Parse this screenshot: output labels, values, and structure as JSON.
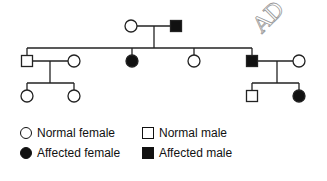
{
  "diagram": {
    "type": "pedigree",
    "annotation": "AD",
    "colors": {
      "line": "#222222",
      "affected": "#111111",
      "normal_fill": "#ffffff",
      "annotation": "#888888"
    },
    "generations": [
      {
        "id": "I",
        "individuals": [
          {
            "id": "I-1",
            "sex": "female",
            "affected": false
          },
          {
            "id": "I-2",
            "sex": "male",
            "affected": true
          }
        ],
        "couples": [
          [
            "I-1",
            "I-2"
          ]
        ]
      },
      {
        "id": "II",
        "individuals": [
          {
            "id": "II-1",
            "sex": "male",
            "affected": false,
            "parents": [
              "I-1",
              "I-2"
            ]
          },
          {
            "id": "II-1s",
            "sex": "female",
            "affected": false,
            "spouse_of": "II-1"
          },
          {
            "id": "II-2",
            "sex": "female",
            "affected": true,
            "parents": [
              "I-1",
              "I-2"
            ]
          },
          {
            "id": "II-3",
            "sex": "female",
            "affected": false,
            "parents": [
              "I-1",
              "I-2"
            ]
          },
          {
            "id": "II-4",
            "sex": "male",
            "affected": true,
            "parents": [
              "I-1",
              "I-2"
            ]
          },
          {
            "id": "II-4s",
            "sex": "female",
            "affected": false,
            "spouse_of": "II-4"
          }
        ]
      },
      {
        "id": "III",
        "individuals": [
          {
            "id": "III-1",
            "sex": "female",
            "affected": false,
            "parents": [
              "II-1",
              "II-1s"
            ]
          },
          {
            "id": "III-2",
            "sex": "female",
            "affected": false,
            "parents": [
              "II-1",
              "II-1s"
            ]
          },
          {
            "id": "III-3",
            "sex": "male",
            "affected": false,
            "parents": [
              "II-4",
              "II-4s"
            ]
          },
          {
            "id": "III-4",
            "sex": "female",
            "affected": true,
            "parents": [
              "II-4",
              "II-4s"
            ]
          }
        ]
      }
    ]
  },
  "legend": [
    {
      "label": "Normal female",
      "sex": "female",
      "affected": false
    },
    {
      "label": "Normal male",
      "sex": "male",
      "affected": false
    },
    {
      "label": "Affected female",
      "sex": "female",
      "affected": true
    },
    {
      "label": "Affected male",
      "sex": "male",
      "affected": true
    }
  ]
}
